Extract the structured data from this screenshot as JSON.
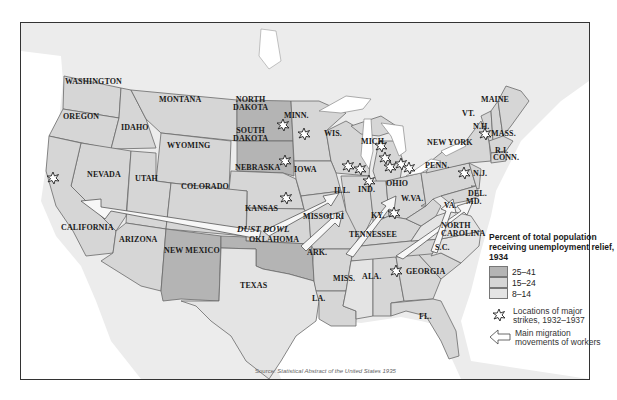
{
  "map": {
    "title": "Percent of total population receiving unemployment relief, 1934",
    "region": "United States (contiguous)",
    "source_prefix": "Source: ",
    "source_title": "Statistical Abstract of the United States 1935",
    "colors": {
      "high": "#b4b4b4",
      "mid": "#d6d6d6",
      "low": "#e4e4e4",
      "water": "#ffffff",
      "foreign": "#ececec",
      "border": "#6a6a6a"
    },
    "region_labels": {
      "dust_bowl": "DUST BOWL"
    },
    "states": [
      {
        "name": "WASHINGTON",
        "category": "15–24"
      },
      {
        "name": "OREGON",
        "category": "15–24"
      },
      {
        "name": "IDAHO",
        "category": "15–24"
      },
      {
        "name": "MONTANA",
        "category": "15–24"
      },
      {
        "name": "WYOMING",
        "category": "15–24"
      },
      {
        "name": "NORTH DAKOTA",
        "category": "25–41"
      },
      {
        "name": "SOUTH DAKOTA",
        "category": "25–41"
      },
      {
        "name": "MINN.",
        "category": "15–24"
      },
      {
        "name": "WIS.",
        "category": "15–24"
      },
      {
        "name": "MICH.",
        "category": "15–24"
      },
      {
        "name": "IOWA",
        "category": "15–24"
      },
      {
        "name": "NEBRASKA",
        "category": "15–24"
      },
      {
        "name": "NEVADA",
        "category": "15–24"
      },
      {
        "name": "UTAH",
        "category": "15–24"
      },
      {
        "name": "COLORADO",
        "category": "15–24"
      },
      {
        "name": "KANSAS",
        "category": "15–24"
      },
      {
        "name": "CALIFORNIA",
        "category": "15–24"
      },
      {
        "name": "ARIZONA",
        "category": "15–24"
      },
      {
        "name": "NEW MEXICO",
        "category": "25–41"
      },
      {
        "name": "OKLAHOMA",
        "category": "25–41"
      },
      {
        "name": "TEXAS",
        "category": "8–14"
      },
      {
        "name": "MISSOURI",
        "category": "15–24"
      },
      {
        "name": "ARK.",
        "category": "15–24"
      },
      {
        "name": "LA.",
        "category": "15–24"
      },
      {
        "name": "MISS.",
        "category": "8–14"
      },
      {
        "name": "ALA.",
        "category": "15–24"
      },
      {
        "name": "TENNESSEE",
        "category": "15–24"
      },
      {
        "name": "KY.",
        "category": "15–24"
      },
      {
        "name": "ILL.",
        "category": "15–24"
      },
      {
        "name": "IND.",
        "category": "15–24"
      },
      {
        "name": "OHIO",
        "category": "15–24"
      },
      {
        "name": "W.VA.",
        "category": "15–24"
      },
      {
        "name": "VA.",
        "category": "8–14"
      },
      {
        "name": "NORTH CAROLINA",
        "category": "8–14"
      },
      {
        "name": "S.C.",
        "category": "15–24"
      },
      {
        "name": "GEORGIA",
        "category": "15–24"
      },
      {
        "name": "FL.",
        "category": "15–24"
      },
      {
        "name": "PENN.",
        "category": "15–24"
      },
      {
        "name": "NEW YORK",
        "category": "15–24"
      },
      {
        "name": "VT.",
        "category": "15–24"
      },
      {
        "name": "N.H.",
        "category": "15–24"
      },
      {
        "name": "MAINE",
        "category": "15–24"
      },
      {
        "name": "MASS.",
        "category": "15–24"
      },
      {
        "name": "R.I.",
        "category": "15–24"
      },
      {
        "name": "CONN.",
        "category": "15–24"
      },
      {
        "name": "N.J.",
        "category": "15–24"
      },
      {
        "name": "DEL.",
        "category": "15–24"
      },
      {
        "name": "MD.",
        "category": "15–24"
      }
    ],
    "strike_locations": [
      "California",
      "Minn.",
      "Minn. (Minneapolis)",
      "Iowa",
      "Kansas",
      "Ill.",
      "Ind.",
      "Ind. (north)",
      "Mich.",
      "Mich. (Detroit)",
      "Ohio",
      "Ohio (Toledo)",
      "Ohio (Akron)",
      "Ky.",
      "W.Va.",
      "Georgia",
      "Mass.",
      "N.J."
    ],
    "migration_arrows": [
      "Dust Bowl to California",
      "Missouri/Kansas to Illinois",
      "Tennessee/Kentucky to Indiana/Ohio",
      "Southeast to Virginia/Mid-Atlantic"
    ]
  },
  "legend": {
    "title": "Percent of total population receiving unemployment relief, 1934",
    "categories": [
      {
        "label": "25–41",
        "color": "#b4b4b4"
      },
      {
        "label": "15–24",
        "color": "#d6d6d6"
      },
      {
        "label": "8–14",
        "color": "#e4e4e4"
      }
    ],
    "strike_label": "Locations of major strikes, 1932–1937",
    "migration_label": "Main migration movements of workers"
  },
  "labels": {
    "washington": "WASHINGTON",
    "oregon": "OREGON",
    "idaho": "IDAHO",
    "montana": "MONTANA",
    "wyoming": "WYOMING",
    "north_dakota_1": "NORTH",
    "north_dakota_2": "DAKOTA",
    "south_dakota_1": "SOUTH",
    "south_dakota_2": "DAKOTA",
    "minn": "MINN.",
    "wis": "WIS.",
    "mich": "MICH.",
    "iowa": "IOWA",
    "nebraska": "NEBRASKA",
    "nevada": "NEVADA",
    "utah": "UTAH",
    "colorado": "COLORADO",
    "kansas": "KANSAS",
    "california": "CALIFORNIA",
    "arizona": "ARIZONA",
    "new_mexico": "NEW MEXICO",
    "dust_bowl": "DUST BOWL",
    "oklahoma": "OKLAHOMA",
    "texas": "TEXAS",
    "missouri": "MISSOURI",
    "ark": "ARK.",
    "la": "LA.",
    "miss": "MISS.",
    "ala": "ALA.",
    "tennessee": "TENNESSEE",
    "ky": "KY.",
    "ill": "ILL.",
    "ind": "IND.",
    "ohio": "OHIO",
    "wva": "W.VA.",
    "va": "VA.",
    "north_carolina_1": "NORTH",
    "north_carolina_2": "CAROLINA",
    "sc": "S.C.",
    "georgia": "GEORGIA",
    "fl": "FL.",
    "penn": "PENN.",
    "new_york": "NEW YORK",
    "vt": "VT.",
    "nh": "N.H.",
    "maine": "MAINE",
    "mass": "MASS.",
    "ri": "R.I.",
    "conn": "CONN.",
    "nj": "N.J.",
    "del": "DEL.",
    "md": "MD."
  }
}
